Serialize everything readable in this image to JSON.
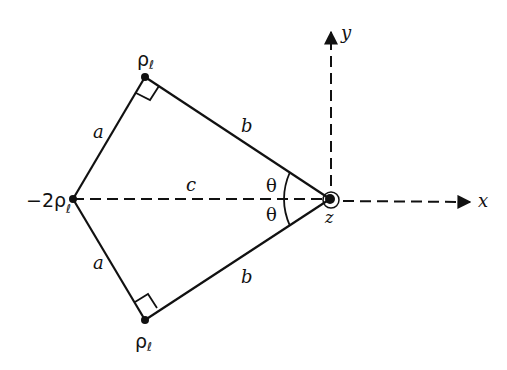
{
  "diagram": {
    "type": "geometry",
    "colors": {
      "stroke": "#111111",
      "background": "#ffffff"
    },
    "points": {
      "left": {
        "label": "−2ρ",
        "subscript": "ℓ"
      },
      "top": {
        "label": "ρ",
        "subscript": "ℓ"
      },
      "bottom": {
        "label": "ρ",
        "subscript": "ℓ"
      },
      "origin": {
        "label": "z"
      }
    },
    "segments": {
      "upper_left": {
        "label": "a"
      },
      "lower_left": {
        "label": "a"
      },
      "upper_right": {
        "label": "b"
      },
      "lower_right": {
        "label": "b"
      },
      "center": {
        "label": "c"
      }
    },
    "angles": {
      "upper": {
        "label": "θ"
      },
      "lower": {
        "label": "θ"
      }
    },
    "axes": {
      "x": {
        "label": "x"
      },
      "y": {
        "label": "y"
      }
    }
  }
}
